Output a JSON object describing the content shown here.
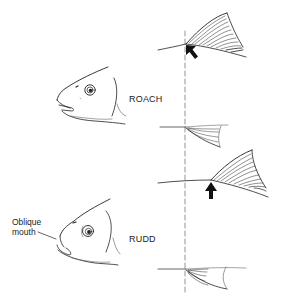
{
  "diagram": {
    "species": [
      {
        "id": "roach",
        "label": "ROACH",
        "note": "Dorsal fin begins directly above pelvic fin origin"
      },
      {
        "id": "rudd",
        "label": "RUDD",
        "note": "Dorsal fin begins behind pelvic fin origin"
      }
    ],
    "annotations": [
      {
        "id": "oblique-mouth",
        "lines": [
          "Oblique",
          "mouth"
        ]
      }
    ],
    "reference_line": "dashed vertical alignment line through pelvic fin origins",
    "colors": {
      "ink": "#222222",
      "background": "#ffffff",
      "dashed_line": "#888888"
    }
  }
}
